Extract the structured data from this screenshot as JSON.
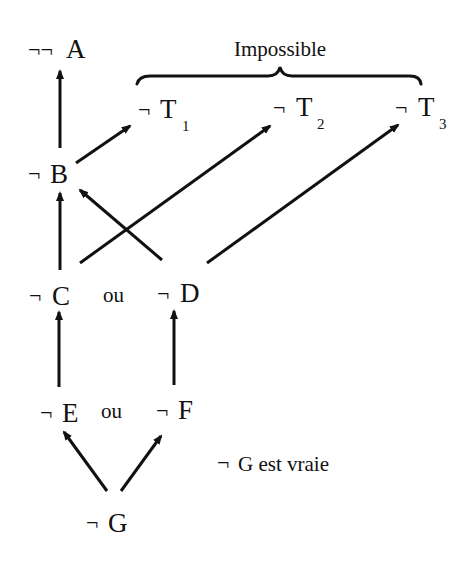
{
  "diagram": {
    "neg_symbol": "¬",
    "nodes": {
      "notnotA": {
        "prefix": "¬¬",
        "letter": "A",
        "sub": ""
      },
      "T1": {
        "prefix": "¬",
        "letter": "T",
        "sub": "1"
      },
      "T2": {
        "prefix": "¬",
        "letter": "T",
        "sub": "2"
      },
      "T3": {
        "prefix": "¬",
        "letter": "T",
        "sub": "3"
      },
      "B": {
        "prefix": "¬",
        "letter": "B",
        "sub": ""
      },
      "C": {
        "prefix": "¬",
        "letter": "C",
        "sub": ""
      },
      "D": {
        "prefix": "¬",
        "letter": "D",
        "sub": ""
      },
      "E": {
        "prefix": "¬",
        "letter": "E",
        "sub": ""
      },
      "F": {
        "prefix": "¬",
        "letter": "F",
        "sub": ""
      },
      "G": {
        "prefix": "¬",
        "letter": "G",
        "sub": ""
      }
    },
    "connectors": {
      "or_CD": "ou",
      "or_EF": "ou"
    },
    "brace_label": "Impossible",
    "note": {
      "prefix": "¬",
      "text": "G est vraie"
    },
    "edges": [
      {
        "from": "G",
        "to": "E"
      },
      {
        "from": "G",
        "to": "F"
      },
      {
        "from": "E",
        "to": "C"
      },
      {
        "from": "F",
        "to": "D"
      },
      {
        "from": "C",
        "to": "B"
      },
      {
        "from": "C",
        "to": "T2"
      },
      {
        "from": "D",
        "to": "B"
      },
      {
        "from": "D",
        "to": "T3"
      },
      {
        "from": "B",
        "to": "notnotA"
      },
      {
        "from": "B",
        "to": "T1"
      }
    ]
  }
}
